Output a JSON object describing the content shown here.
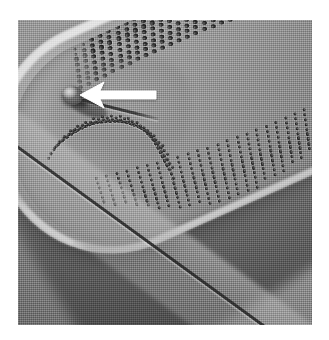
{
  "image": {
    "kind": "sem-micrograph",
    "subject": "diatom valve apex",
    "modality": "scanning electron microscope",
    "color_mode": "grayscale",
    "canvas": {
      "width": 329,
      "height": 340
    },
    "plate": {
      "left": 18,
      "top": 20,
      "width": 294,
      "height": 305
    },
    "margin_color": "#ffffff"
  },
  "palette": {
    "background_light": "#a6a6a6",
    "background_dark": "#7c7c7c",
    "valve_highlight": "#dedede",
    "valve_midtone": "#9a9a9a",
    "valve_shadow": "#7a7a7a",
    "areola_dark": "#202020",
    "raphe_line": "#2f2f2f",
    "annotation_arrow": "#ffffff"
  },
  "annotations": [
    {
      "name": "stigma-arrow",
      "shape": "solid-filled-arrow",
      "color": "#ffffff",
      "direction": "left",
      "tip": {
        "x": 85,
        "y": 92
      },
      "tail": {
        "x": 141,
        "y": 92
      },
      "length": 56,
      "points_at": "raised circular stigma near valve apex"
    }
  ],
  "features": [
    {
      "name": "valve-apex",
      "description": "rounded head pole of the valve, upper left"
    },
    {
      "name": "outer-mantle-rim",
      "description": "bright specular edge following the valve outline"
    },
    {
      "name": "stigma",
      "description": "single raised circular pore beside the proximal raphe end"
    },
    {
      "name": "raphe",
      "description": "dark slit running diagonally from upper left to lower right"
    },
    {
      "name": "sternum",
      "description": "smooth axial area flanking the raphe, free of areolae"
    },
    {
      "name": "striae",
      "description": "transverse rows of round areolae radiating from the sternum"
    },
    {
      "name": "helictoglossa",
      "description": "terminal raphe fissure hook at the apex"
    }
  ],
  "caption": "",
  "chart_data": null
}
